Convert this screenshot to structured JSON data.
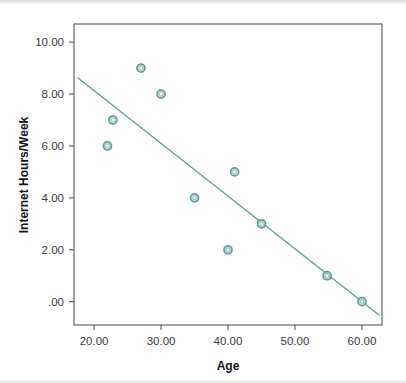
{
  "chart_data": {
    "type": "scatter",
    "title": "",
    "xlabel": "Age",
    "ylabel": "Internet Hours/Week",
    "xlim": [
      17.0,
      63.0
    ],
    "ylim": [
      -0.9,
      10.7
    ],
    "grid": false,
    "legend": "none",
    "xticks": [
      20,
      30,
      40,
      50,
      60
    ],
    "xticklabels": [
      "20.00",
      "30.00",
      "40.00",
      "50.00",
      "60.00"
    ],
    "yticks": [
      0,
      2,
      4,
      6,
      8,
      10
    ],
    "yticklabels": [
      ".00",
      "2.00",
      "4.00",
      "6.00",
      "8.00",
      "10.00"
    ],
    "series": [
      {
        "name": "observations",
        "marker": "open-circle",
        "color": "#5f9a96",
        "points": [
          {
            "x": 22.0,
            "y": 6.0
          },
          {
            "x": 22.8,
            "y": 7.0
          },
          {
            "x": 27.0,
            "y": 9.0
          },
          {
            "x": 30.0,
            "y": 8.0
          },
          {
            "x": 35.0,
            "y": 4.0
          },
          {
            "x": 40.0,
            "y": 2.0
          },
          {
            "x": 41.0,
            "y": 5.0
          },
          {
            "x": 45.0,
            "y": 3.0
          },
          {
            "x": 54.8,
            "y": 1.0
          },
          {
            "x": 60.0,
            "y": 0.0
          }
        ]
      }
    ],
    "fit_line": {
      "name": "linear-fit",
      "color": "#5f9a96",
      "x_start": 17.6,
      "y_start": 8.62,
      "x_end": 62.6,
      "y_end": -0.52
    },
    "colors": {
      "marker": "#5f9a96",
      "marker_fill": "#a7c6c2",
      "line": "#5f9a96",
      "frame": "#565660",
      "tick_text": "#3a3a46",
      "axis_title": "#14141c",
      "background": "#ffffff"
    }
  }
}
